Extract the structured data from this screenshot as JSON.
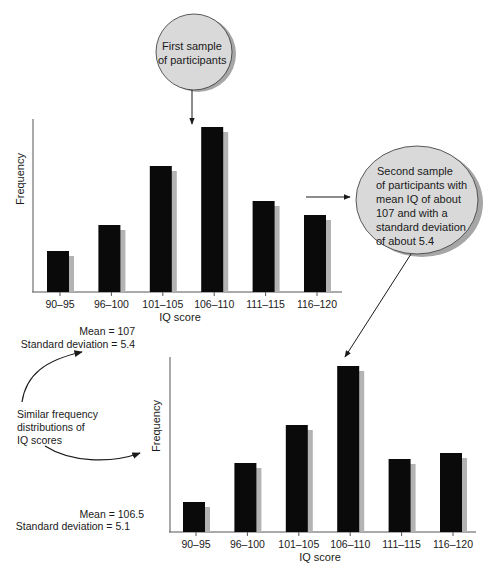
{
  "header_fragment": "",
  "bubbles": {
    "first": {
      "lines": [
        "First sample",
        "of participants"
      ]
    },
    "second": {
      "lines": [
        "Second sample",
        "of participants with",
        "mean IQ of about",
        "107 and with a",
        "standard deviation",
        "of about 5.4"
      ]
    }
  },
  "annotations": {
    "top_stats": {
      "mean": "Mean = 107",
      "sd": "Standard deviation = 5.4"
    },
    "similar": {
      "lines": [
        "Similar frequency",
        "distributions of",
        "IQ scores"
      ]
    },
    "bottom_stats": {
      "mean": "Mean = 106.5",
      "sd": "Standard deviation = 5.1"
    }
  },
  "colors": {
    "bar": "#0a0a0a",
    "bar_shadow": "#b3b3b3",
    "bubble_fill": "#d9d9d9",
    "bubble_shadow": "#a6a6a6",
    "axis": "#555555"
  },
  "chart_data": [
    {
      "type": "bar",
      "title": "First sample of participants",
      "xlabel": "IQ score",
      "ylabel": "Frequency",
      "categories": [
        "90–95",
        "96–100",
        "101–105",
        "106–110",
        "111–115",
        "116–120"
      ],
      "values": [
        41,
        67,
        126,
        165,
        91,
        77
      ],
      "values_note": "relative bar heights (no y-axis scale shown)",
      "grid": false,
      "legend": null
    },
    {
      "type": "bar",
      "title": "Second sample of participants",
      "xlabel": "IQ score",
      "ylabel": "Frequency",
      "categories": [
        "90–95",
        "96–100",
        "101–105",
        "106–110",
        "111–115",
        "116–120"
      ],
      "values": [
        30,
        69,
        107,
        166,
        73,
        79
      ],
      "values_note": "relative bar heights (no y-axis scale shown)",
      "grid": false,
      "legend": null
    }
  ]
}
